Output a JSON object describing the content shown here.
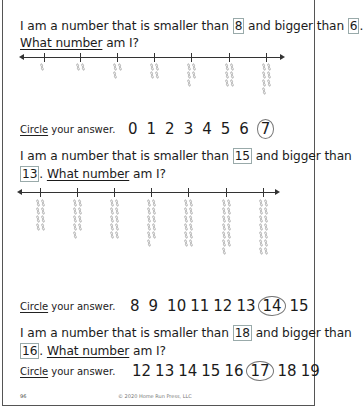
{
  "page": {
    "page_number": "96",
    "copyright": "© 2020 Home Run Press, LLC"
  },
  "questions": [
    {
      "prefix": "I am a number that is smaller than ",
      "upper": "8",
      "middle": " and bigger than ",
      "lower": "6",
      "suffix": ".",
      "ask_underlined": "What number",
      "ask_rest": " am I?",
      "number_line": {
        "tally_counts": [
          1,
          2,
          3,
          4,
          5,
          6,
          7
        ]
      },
      "circle_label_underlined": "Circle",
      "circle_label_rest": " your answer.",
      "choices": [
        "0",
        "1",
        "2",
        "3",
        "4",
        "5",
        "6",
        "7"
      ],
      "circled_answer": "7"
    },
    {
      "prefix": "I am a number that is smaller than ",
      "upper": "15",
      "middle": " and bigger than",
      "lower": "13",
      "suffix": ".",
      "ask_underlined": "What number",
      "ask_rest": " am I?",
      "number_line": {
        "tally_counts": [
          8,
          9,
          10,
          11,
          12,
          13,
          14
        ]
      },
      "circle_label_underlined": "Circle",
      "circle_label_rest": " your answer.",
      "choices": [
        "8",
        "9",
        "10",
        "11",
        "12",
        "13",
        "14",
        "15"
      ],
      "circled_answer": "14"
    },
    {
      "prefix": "I am a number that is smaller than ",
      "upper": "18",
      "middle": " and bigger than",
      "lower": "16",
      "suffix": ".",
      "ask_underlined": "What number",
      "ask_rest": " am I?",
      "circle_label_underlined": "Circle",
      "circle_label_rest": " your answer.",
      "choices": [
        "12",
        "13",
        "14",
        "15",
        "16",
        "17",
        "18",
        "19"
      ],
      "circled_answer": "17"
    }
  ],
  "icons": {
    "tally": "chain-link-icon"
  }
}
